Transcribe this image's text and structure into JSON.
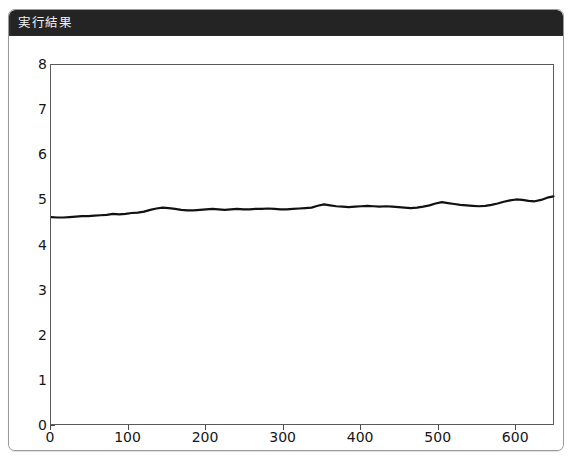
{
  "window": {
    "title": "実行結果"
  },
  "chart_data": {
    "type": "line",
    "title": "",
    "subtitle": "",
    "xlabel": "",
    "ylabel": "",
    "xlim": [
      0,
      650
    ],
    "ylim": [
      0,
      8
    ],
    "grid": false,
    "legend": null,
    "line_color": "#111111",
    "line_width": 2.2,
    "x_ticks": [
      0,
      100,
      200,
      300,
      400,
      500,
      600
    ],
    "y_ticks": [
      0,
      1,
      2,
      3,
      4,
      5,
      6,
      7,
      8
    ],
    "x_tick_labels": [
      "0",
      "100",
      "200",
      "300",
      "400",
      "500",
      "600"
    ],
    "y_tick_labels": [
      "0",
      "1",
      "2",
      "3",
      "4",
      "5",
      "6",
      "7",
      "8"
    ],
    "series": [
      {
        "name": "series-1",
        "x": [
          0,
          8,
          16,
          24,
          32,
          40,
          48,
          56,
          64,
          72,
          80,
          88,
          96,
          104,
          112,
          120,
          128,
          136,
          144,
          152,
          160,
          168,
          176,
          184,
          192,
          200,
          208,
          216,
          224,
          232,
          240,
          248,
          256,
          264,
          272,
          280,
          288,
          296,
          304,
          312,
          320,
          328,
          336,
          344,
          352,
          360,
          368,
          376,
          384,
          392,
          400,
          408,
          416,
          424,
          432,
          440,
          448,
          456,
          464,
          472,
          480,
          488,
          496,
          504,
          512,
          520,
          528,
          536,
          544,
          552,
          560,
          568,
          576,
          584,
          592,
          600,
          608,
          616,
          624,
          632,
          640,
          648
        ],
        "values": [
          4.63,
          4.62,
          4.62,
          4.63,
          4.64,
          4.65,
          4.65,
          4.66,
          4.67,
          4.68,
          4.7,
          4.69,
          4.7,
          4.72,
          4.73,
          4.75,
          4.79,
          4.82,
          4.84,
          4.83,
          4.81,
          4.79,
          4.78,
          4.78,
          4.79,
          4.8,
          4.81,
          4.8,
          4.79,
          4.8,
          4.81,
          4.8,
          4.8,
          4.81,
          4.81,
          4.82,
          4.81,
          4.8,
          4.8,
          4.81,
          4.82,
          4.83,
          4.84,
          4.88,
          4.91,
          4.89,
          4.87,
          4.86,
          4.85,
          4.86,
          4.87,
          4.88,
          4.87,
          4.86,
          4.87,
          4.86,
          4.85,
          4.84,
          4.83,
          4.84,
          4.86,
          4.89,
          4.93,
          4.96,
          4.94,
          4.92,
          4.9,
          4.89,
          4.88,
          4.87,
          4.88,
          4.9,
          4.93,
          4.97,
          5.0,
          5.02,
          5.01,
          4.99,
          4.98,
          5.01,
          5.06,
          5.09
        ]
      }
    ]
  }
}
